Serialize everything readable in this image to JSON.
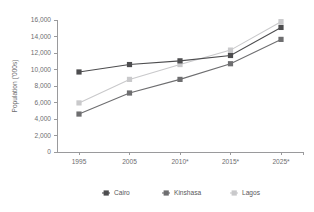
{
  "chart_data": {
    "type": "line",
    "title": "",
    "xlabel": "",
    "ylabel": "Population ('000s)",
    "categories": [
      "1995",
      "2005",
      "2010*",
      "2015*",
      "2025*"
    ],
    "ylim": [
      0,
      16000
    ],
    "ytick_values": [
      0,
      2000,
      4000,
      6000,
      8000,
      10000,
      12000,
      14000,
      16000
    ],
    "ytick_labels": [
      "0",
      "2,000",
      "4,000",
      "6,000",
      "8,000",
      "10,000",
      "12,000",
      "14,000",
      "16,000"
    ],
    "grid": false,
    "legend_position": "bottom",
    "series": [
      {
        "name": "Cairo",
        "color": "#4d4d4f",
        "marker": "square",
        "values": [
          9700,
          10600,
          11050,
          11700,
          15100
        ]
      },
      {
        "name": "Kinshasa",
        "color": "#6e6e70",
        "marker": "square",
        "values": [
          4600,
          7150,
          8800,
          10700,
          13650
        ]
      },
      {
        "name": "Lagos",
        "color": "#c9c9cb",
        "marker": "square",
        "values": [
          5950,
          8800,
          10600,
          12350,
          15800
        ]
      }
    ]
  }
}
